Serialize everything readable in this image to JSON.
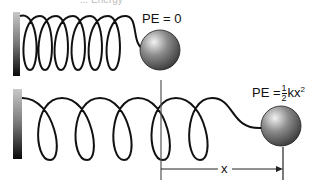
{
  "title_partial": "... Energy",
  "top": {
    "label": "PE = 0"
  },
  "bottom": {
    "label_prefix": "PE =",
    "frac_num": "1",
    "frac_den": "2",
    "label_suffix": "kx",
    "exponent": "2"
  },
  "displacement": {
    "label": "x"
  },
  "colors": {
    "ball": "#6b6b6b",
    "spring": "#111111",
    "wall_top": "#bdbdbd",
    "wall_bottom": "#111111"
  }
}
